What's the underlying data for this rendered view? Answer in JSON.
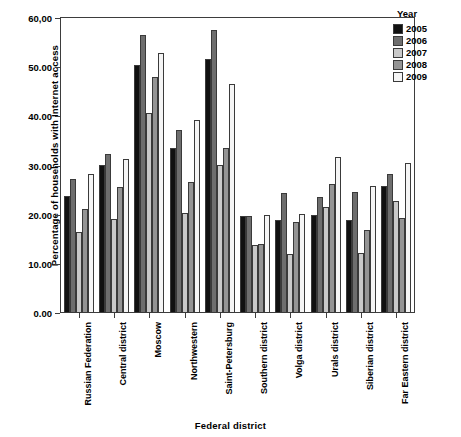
{
  "chart_data": {
    "type": "bar",
    "title": "",
    "xlabel": "Federal district",
    "ylabel": "Percentage of households with Internet access",
    "ylim": [
      0,
      60
    ],
    "yticks": [
      "0.00",
      "10.00",
      "20.00",
      "30.00",
      "40.00",
      "50.00",
      "60,00"
    ],
    "ytick_values": [
      0,
      10,
      20,
      30,
      40,
      50,
      60
    ],
    "grid": false,
    "legend_position": "right",
    "legend_title": "Year",
    "categories": [
      "Russian Federation",
      "Central district",
      "Moscow",
      "Northwestern",
      "Saint-Petersburg",
      "Southern district",
      "Volga district",
      "Urals district",
      "Siberian district",
      "Far Eastern district"
    ],
    "series": [
      {
        "name": "2005",
        "color": "#111111",
        "values": [
          23.8,
          30.1,
          50.5,
          33.5,
          51.6,
          19.8,
          19.0,
          20.0,
          19.0,
          25.9
        ]
      },
      {
        "name": "2006",
        "color": "#6e6e6e",
        "values": [
          27.3,
          32.4,
          56.5,
          37.3,
          57.5,
          19.8,
          24.5,
          23.6,
          24.6,
          28.3
        ]
      },
      {
        "name": "2007",
        "color": "#c9c9c9",
        "values": [
          16.5,
          19.2,
          40.7,
          20.3,
          30.1,
          13.9,
          12.1,
          21.6,
          12.3,
          22.8
        ]
      },
      {
        "name": "2008",
        "color": "#949494",
        "values": [
          21.1,
          25.6,
          48.1,
          26.7,
          33.5,
          14.1,
          18.6,
          26.2,
          16.9,
          19.3
        ]
      },
      {
        "name": "2009",
        "color": "#f5f5f5",
        "values": [
          28.2,
          31.4,
          52.9,
          39.3,
          46.6,
          19.9,
          20.2,
          31.8,
          25.8,
          30.6
        ]
      }
    ]
  },
  "legend": {
    "title": "Year",
    "entries": [
      {
        "label": "2005",
        "color": "#111111"
      },
      {
        "label": "2006",
        "color": "#6e6e6e"
      },
      {
        "label": "2007",
        "color": "#c9c9c9"
      },
      {
        "label": "2008",
        "color": "#949494"
      },
      {
        "label": "2009",
        "color": "#f5f5f5"
      }
    ]
  },
  "axes": {
    "x_title": "Federal district",
    "y_title": "Percentage of households with Internet access"
  }
}
